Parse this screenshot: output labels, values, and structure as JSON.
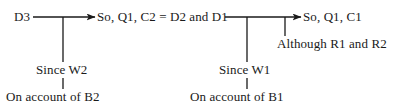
{
  "diagram": {
    "type": "toulmin-argument-diagram",
    "width": 398,
    "height": 109,
    "background_color": "#ffffff",
    "stroke_color": "#1a1a1a",
    "text_color": "#1a1a1a"
  },
  "nodes": {
    "datum_left": "D3",
    "claim_middle": "So, Q1, C2 = D2 and D1",
    "claim_right": "So, Q1, C1",
    "rebuttal": "Although R1 and R2",
    "warrant_left": "Since W2",
    "warrant_right": "Since W1",
    "backing_left": "On account of B2",
    "backing_right": "On account of B1"
  },
  "connectors": [
    {
      "name": "arrow-d3-to-claim-middle",
      "kind": "horizontal-arrow",
      "from": "datum_left",
      "to": "claim_middle"
    },
    {
      "name": "arrow-claim-middle-to-claim-right",
      "kind": "horizontal-arrow",
      "from": "claim_middle",
      "to": "claim_right"
    },
    {
      "name": "line-warrant-left",
      "kind": "vertical-line",
      "from": "arrow-d3-to-claim-middle",
      "to": "warrant_left"
    },
    {
      "name": "line-warrant-right",
      "kind": "vertical-line",
      "from": "arrow-claim-middle-to-claim-right",
      "to": "warrant_right"
    },
    {
      "name": "line-rebuttal",
      "kind": "vertical-line",
      "from": "arrow-claim-middle-to-claim-right",
      "to": "rebuttal"
    },
    {
      "name": "line-backing-left",
      "kind": "vertical-line",
      "from": "warrant_left",
      "to": "backing_left"
    },
    {
      "name": "line-backing-right",
      "kind": "vertical-line",
      "from": "warrant_right",
      "to": "backing_right"
    }
  ]
}
